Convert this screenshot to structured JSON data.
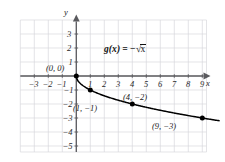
{
  "chart_data": {
    "type": "line",
    "title": "",
    "subtitle": "",
    "equation_label": "g(x) = −√x",
    "function_name": "g(x)",
    "equals": "=",
    "minus": "−",
    "radical": "√",
    "radicand": "x",
    "xlabel": "x",
    "ylabel": "y",
    "xlim": [
      -3.5,
      10.2
    ],
    "ylim": [
      -5.6,
      3.6
    ],
    "grid": true,
    "grid_color": "#d8d8dc",
    "axis_color": "#58585c",
    "curve_color": "#000000",
    "legend": "none",
    "x_ticks": [
      -3,
      -2,
      -1,
      1,
      2,
      3,
      4,
      5,
      6,
      7,
      8,
      9
    ],
    "x_tick_labels": [
      "−3",
      "−2",
      "−1",
      "1",
      "2",
      "3",
      "4",
      "5",
      "6",
      "7",
      "8",
      "9"
    ],
    "y_ticks": [
      3,
      2,
      1,
      -1,
      -2,
      -3,
      -4,
      -5
    ],
    "y_tick_labels": [
      "3",
      "2",
      "1",
      "−1",
      "−2",
      "−3",
      "−4",
      "−5"
    ],
    "series": [
      {
        "name": "g(x) = −√x",
        "x": [
          0,
          0.25,
          0.5,
          1,
          1.5,
          2,
          2.5,
          3,
          4,
          5,
          6,
          7,
          8,
          9,
          10
        ],
        "y": [
          0,
          -0.5,
          -0.707,
          -1,
          -1.225,
          -1.414,
          -1.581,
          -1.732,
          -2,
          -2.236,
          -2.449,
          -2.646,
          -2.828,
          -3,
          -3.162
        ]
      }
    ],
    "marked_points": [
      {
        "x": 0,
        "y": 0,
        "label": "(0, 0)"
      },
      {
        "x": 1,
        "y": -1,
        "label": "(1, −1)"
      },
      {
        "x": 4,
        "y": -2,
        "label": "(4, −2)"
      },
      {
        "x": 9,
        "y": -3,
        "label": "(9, −3)"
      }
    ]
  }
}
